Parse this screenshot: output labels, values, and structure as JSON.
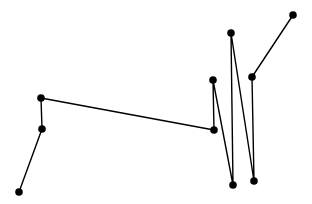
{
  "chart_data": {
    "type": "line",
    "title": "",
    "xlabel": "",
    "ylabel": "",
    "grid": false,
    "axes_visible": false,
    "legend": null,
    "marker": "circle",
    "line_color": "#000000",
    "marker_color": "#000000",
    "series": [
      {
        "name": "path",
        "points_px": [
          [
            19,
            192
          ],
          [
            42,
            129
          ],
          [
            41,
            98
          ],
          [
            214,
            130
          ],
          [
            213,
            80
          ],
          [
            233,
            185
          ],
          [
            231,
            33
          ],
          [
            254,
            181
          ],
          [
            252,
            77
          ],
          [
            293,
            15
          ]
        ]
      }
    ]
  }
}
